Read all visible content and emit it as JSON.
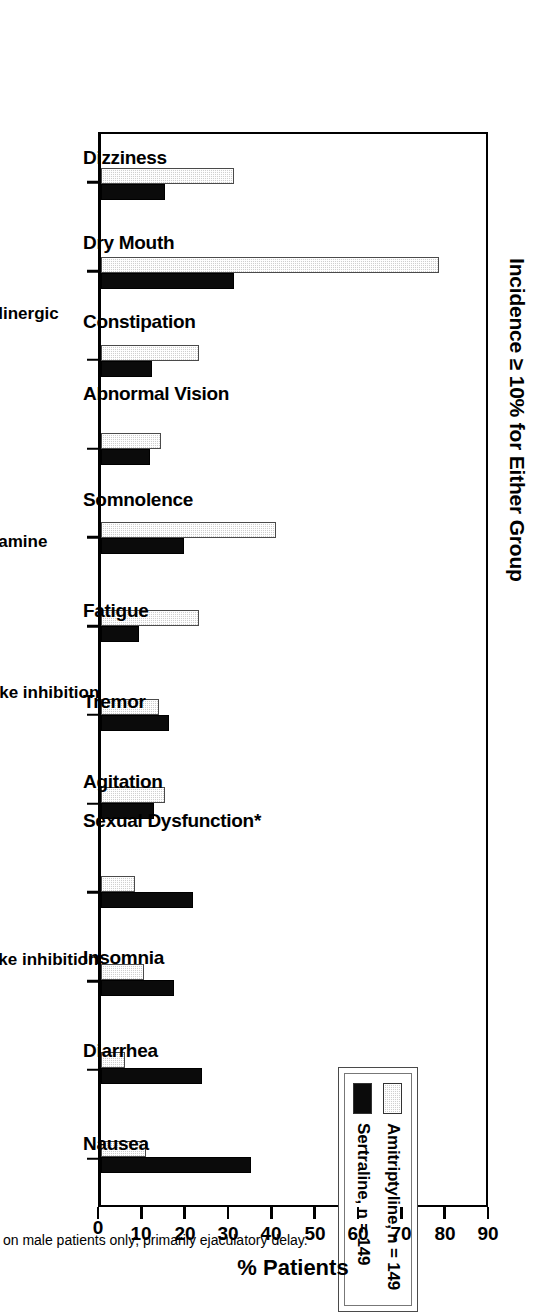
{
  "figure": {
    "title": "Incidence ≥ 10% for Either Group",
    "footnote": "* Based on male patients only; primarily ejaculatory delay."
  },
  "legend": {
    "entries": [
      {
        "label": "Amitriptyline, n = 149",
        "key": "amitriptyline",
        "color": "#cfcfcf"
      },
      {
        "label": "Sertraline, n = 149",
        "key": "sertraline",
        "color": "#0b0b0b"
      }
    ]
  },
  "axis": {
    "value_title": "% Patients",
    "ticks": [
      0,
      10,
      20,
      30,
      40,
      50,
      60,
      70,
      80,
      90
    ],
    "tick_labels": [
      "0",
      "10",
      "20",
      "30",
      "40",
      "50",
      "60",
      "70",
      "80",
      "90"
    ],
    "range": [
      0,
      90
    ]
  },
  "mechanism_groups": [
    {
      "label": "Anti-α",
      "sub": "1",
      "span": 1
    },
    {
      "label": "Anticholinergic",
      "sub": "",
      "span": 3
    },
    {
      "label": "Antihistamine",
      "sub": "",
      "span": 2
    },
    {
      "label": "NE uptake inhibition",
      "sub": "",
      "span": 2
    },
    {
      "label": "SE uptake inhibition",
      "sub": "",
      "span": 4
    }
  ],
  "chart_data": {
    "type": "bar",
    "title": "Incidence ≥ 10% for Either Group",
    "xlabel": "",
    "ylabel": "% Patients",
    "ylim": [
      0,
      90
    ],
    "grid": false,
    "legend_position": "inside-upper-right",
    "orientation": "vertical-rotated-90",
    "categories": [
      "Dizziness",
      "Dry Mouth",
      "Constipation",
      "Abnormal Vision",
      "Somnolence",
      "Fatigue",
      "Tremor",
      "Agitation",
      "Sexual Dysfunction*",
      "Insomnia",
      "Diarrhea",
      "Nausea"
    ],
    "series": [
      {
        "name": "Amitriptyline, n = 149",
        "values": [
          31,
          79,
          23,
          14,
          41,
          23,
          13.5,
          15,
          8,
          10,
          5.5,
          10.5
        ]
      },
      {
        "name": "Sertraline, n = 149",
        "values": [
          15,
          31,
          12,
          11.5,
          19.5,
          9,
          16,
          12.5,
          21.5,
          17,
          23.5,
          35
        ]
      }
    ],
    "annotations": [
      "* Based on male patients only; primarily ejaculatory delay."
    ]
  }
}
